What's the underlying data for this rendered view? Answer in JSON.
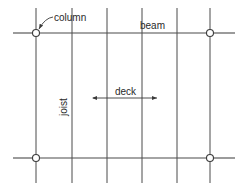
{
  "diagram": {
    "labels": {
      "column": "column",
      "beam": "beam",
      "joist": "joist",
      "deck": "deck"
    },
    "colors": {
      "line": "#4a4a4a",
      "text": "#2a2a2a",
      "background": "#ffffff"
    },
    "beams": [
      {
        "y": 33,
        "x1": 13,
        "x2": 235
      },
      {
        "y": 158,
        "x1": 13,
        "x2": 235
      }
    ],
    "joists_x": [
      36,
      72,
      107,
      142,
      177,
      210
    ],
    "columns": [
      {
        "x": 36,
        "y": 33
      },
      {
        "x": 210,
        "y": 33
      },
      {
        "x": 36,
        "y": 158
      },
      {
        "x": 210,
        "y": 158
      }
    ]
  }
}
